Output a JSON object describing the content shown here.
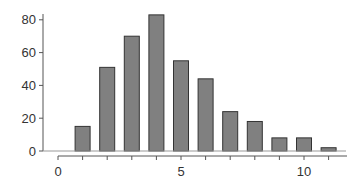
{
  "chart_data": {
    "type": "bar",
    "title": "",
    "xlabel": "",
    "ylabel": "",
    "categories": [
      1,
      2,
      3,
      4,
      5,
      6,
      7,
      8,
      9,
      10,
      11
    ],
    "values": [
      15,
      51,
      70,
      83,
      55,
      44,
      24,
      18,
      8,
      8,
      2
    ],
    "xlim": [
      0,
      11.6
    ],
    "ylim": [
      0,
      88
    ],
    "xticks": [
      0,
      1,
      2,
      3,
      4,
      5,
      6,
      7,
      8,
      9,
      10,
      11
    ],
    "xtick_labels": [
      "0",
      "",
      "",
      "",
      "",
      "5",
      "",
      "",
      "",
      "",
      "10",
      ""
    ],
    "yticks": [
      0,
      20,
      40,
      60,
      80
    ],
    "ytick_labels": [
      "0",
      "20",
      "40",
      "60",
      "80"
    ],
    "grid": false,
    "legend": null,
    "colors": {
      "bar_fill": "#808080",
      "bar_edge": "#333333",
      "axis": "#555555",
      "text": "#333333"
    }
  }
}
